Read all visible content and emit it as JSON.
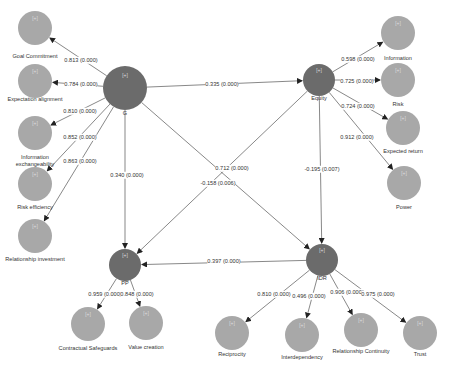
{
  "diagram": {
    "type": "PLS-SEM path model",
    "colors": {
      "construct": "#6b6b6b",
      "indicator": "#a8a8a8",
      "edge": "#555555",
      "text": "#333333"
    },
    "constructs": [
      {
        "id": "G",
        "label": "G",
        "tag": "[+]",
        "x": 125,
        "y": 88,
        "r": 22
      },
      {
        "id": "Equity",
        "label": "Equity",
        "tag": "[+]",
        "x": 319,
        "y": 80,
        "r": 16
      },
      {
        "id": "PP",
        "label": "PP",
        "tag": "[+]",
        "x": 125,
        "y": 265,
        "r": 16
      },
      {
        "id": "IDR",
        "label": "IDR",
        "tag": "[+]",
        "x": 322,
        "y": 260,
        "r": 16
      }
    ],
    "indicators": [
      {
        "id": "goal",
        "label": "Goal Commitment",
        "tag": "[+]",
        "x": 35,
        "y": 28
      },
      {
        "id": "expect",
        "label": "Expectation alignment",
        "tag": "[+]",
        "x": 35,
        "y": 81
      },
      {
        "id": "infoex",
        "label": "Information exchangeability",
        "tag": "[+]",
        "x": 35,
        "y": 133
      },
      {
        "id": "riskeff",
        "label": "Risk efficiency",
        "tag": "[+]",
        "x": 35,
        "y": 184
      },
      {
        "id": "relinv",
        "label": "Relationship investment",
        "tag": "[+]",
        "x": 35,
        "y": 236
      },
      {
        "id": "information",
        "label": "Information",
        "tag": "[+]",
        "x": 398,
        "y": 33
      },
      {
        "id": "risk",
        "label": "Risk",
        "tag": "[+]",
        "x": 398,
        "y": 80
      },
      {
        "id": "expret",
        "label": "Expected return",
        "tag": "[+]",
        "x": 403,
        "y": 128
      },
      {
        "id": "power",
        "label": "Power",
        "tag": "[+]",
        "x": 404,
        "y": 183
      },
      {
        "id": "contract",
        "label": "Contractual Safeguards",
        "tag": "[+]",
        "x": 88,
        "y": 324
      },
      {
        "id": "valuecr",
        "label": "Value creation",
        "tag": "[+]",
        "x": 146,
        "y": 323
      },
      {
        "id": "recip",
        "label": "Reciprocity",
        "tag": "[+]",
        "x": 232,
        "y": 333
      },
      {
        "id": "interdep",
        "label": "Interdependency",
        "tag": "[+]",
        "x": 302,
        "y": 335
      },
      {
        "id": "relcont",
        "label": "Relationship Continuity",
        "tag": "[+]",
        "x": 361,
        "y": 330
      },
      {
        "id": "trust",
        "label": "Trust",
        "tag": "[+]",
        "x": 420,
        "y": 333
      }
    ],
    "paths": [
      {
        "from": "G",
        "to": "Equity",
        "label": "0.335 (0.000)",
        "lx": 222,
        "ly": 84
      },
      {
        "from": "G",
        "to": "PP",
        "label": "0.340 (0.000)",
        "lx": 127,
        "ly": 175
      },
      {
        "from": "G",
        "to": "IDR",
        "label": "0.712 (0.000)",
        "lx": 232,
        "ly": 168
      },
      {
        "from": "Equity",
        "to": "PP",
        "label": "-0.158 (0.006)",
        "lx": 218,
        "ly": 183
      },
      {
        "from": "Equity",
        "to": "IDR",
        "label": "-0.195 (0.007)",
        "lx": 322,
        "ly": 169
      },
      {
        "from": "IDR",
        "to": "PP",
        "label": "0.397 (0.000)",
        "lx": 224,
        "ly": 261
      }
    ],
    "loadings": [
      {
        "from": "G",
        "to": "goal",
        "label": "0.813 (0.000)",
        "lx": 81,
        "ly": 60
      },
      {
        "from": "G",
        "to": "expect",
        "label": "0.784 (0.000)",
        "lx": 81,
        "ly": 84
      },
      {
        "from": "G",
        "to": "infoex",
        "label": "0.810 (0.000)",
        "lx": 80,
        "ly": 111
      },
      {
        "from": "G",
        "to": "riskeff",
        "label": "0.852 (0.000)",
        "lx": 80,
        "ly": 137
      },
      {
        "from": "G",
        "to": "relinv",
        "label": "0.863 (0.000)",
        "lx": 80,
        "ly": 161
      },
      {
        "from": "Equity",
        "to": "information",
        "label": "0.598 (0.000)",
        "lx": 358,
        "ly": 59
      },
      {
        "from": "Equity",
        "to": "risk",
        "label": "0.725 (0.000)",
        "lx": 357,
        "ly": 81
      },
      {
        "from": "Equity",
        "to": "expret",
        "label": "0.724 (0.000)",
        "lx": 358,
        "ly": 106
      },
      {
        "from": "Equity",
        "to": "power",
        "label": "0.912 (0.000)",
        "lx": 357,
        "ly": 137
      },
      {
        "from": "PP",
        "to": "contract",
        "label": "0.959 (0.000)",
        "lx": 105,
        "ly": 294
      },
      {
        "from": "PP",
        "to": "valuecr",
        "label": "0.848 (0.000)",
        "lx": 137,
        "ly": 294
      },
      {
        "from": "IDR",
        "to": "recip",
        "label": "0.810 (0.000)",
        "lx": 274,
        "ly": 294
      },
      {
        "from": "IDR",
        "to": "interdep",
        "label": "0.496 (0.000)",
        "lx": 309,
        "ly": 296
      },
      {
        "from": "IDR",
        "to": "relcont",
        "label": "0.906 (0.000)",
        "lx": 347,
        "ly": 292
      },
      {
        "from": "IDR",
        "to": "trust",
        "label": "0.975 (0.000)",
        "lx": 378,
        "ly": 294
      }
    ],
    "node_label_pos": {
      "G": {
        "x": 125,
        "y": 113
      },
      "Equity": {
        "x": 319,
        "y": 98
      },
      "PP": {
        "x": 125,
        "y": 283
      },
      "IDR": {
        "x": 322,
        "y": 278
      },
      "goal": {
        "x": 35,
        "y": 56
      },
      "expect": {
        "x": 35,
        "y": 99
      },
      "infoex": {
        "x": 35,
        "y": 157
      },
      "riskeff": {
        "x": 35,
        "y": 207
      },
      "relinv": {
        "x": 35,
        "y": 259
      },
      "information": {
        "x": 398,
        "y": 58
      },
      "risk": {
        "x": 398,
        "y": 104
      },
      "expret": {
        "x": 403,
        "y": 151
      },
      "power": {
        "x": 404,
        "y": 207
      },
      "contract": {
        "x": 88,
        "y": 348
      },
      "valuecr": {
        "x": 146,
        "y": 347
      },
      "recip": {
        "x": 232,
        "y": 354
      },
      "interdep": {
        "x": 302,
        "y": 357
      },
      "relcont": {
        "x": 361,
        "y": 351
      },
      "trust": {
        "x": 420,
        "y": 354
      }
    }
  }
}
